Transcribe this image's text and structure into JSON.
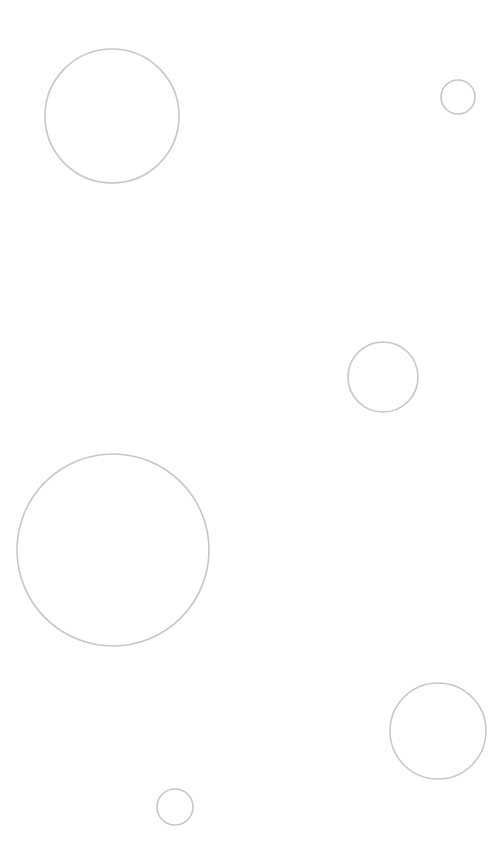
{
  "canvas": {
    "width": 504,
    "height": 855,
    "background": "#ffffff",
    "stroke_color": "#c6c6c6",
    "stroke_width": 1.6
  },
  "circles": [
    {
      "id": "circle-1",
      "cx": 112,
      "cy": 116,
      "r": 67
    },
    {
      "id": "circle-2",
      "cx": 458,
      "cy": 97,
      "r": 17
    },
    {
      "id": "circle-3",
      "cx": 383,
      "cy": 377,
      "r": 35
    },
    {
      "id": "circle-4",
      "cx": 113,
      "cy": 550,
      "r": 96
    },
    {
      "id": "circle-5",
      "cx": 438,
      "cy": 731,
      "r": 48
    },
    {
      "id": "circle-6",
      "cx": 175,
      "cy": 807,
      "r": 18
    }
  ]
}
